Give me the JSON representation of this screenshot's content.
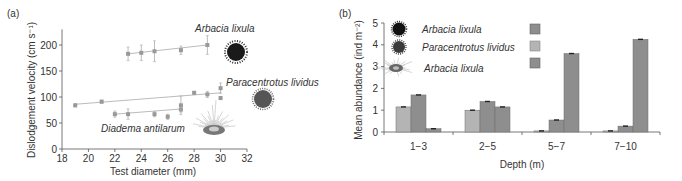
{
  "chart_data": [
    {
      "panel": "(a)",
      "type": "scatter",
      "title": "",
      "xlabel": "Test diameter (mm)",
      "ylabel": "Dislodgement velocity (cm s⁻¹)",
      "xlim": [
        18,
        32
      ],
      "ylim": [
        0,
        230
      ],
      "xticks": [
        18,
        20,
        22,
        24,
        26,
        28,
        30,
        32
      ],
      "yticks": [
        0,
        50,
        100,
        150,
        200
      ],
      "grid": false,
      "series": [
        {
          "name": "Arbacia lixula",
          "points": [
            {
              "x": 23,
              "y": 183,
              "err": 13
            },
            {
              "x": 24,
              "y": 185,
              "err": 15
            },
            {
              "x": 25,
              "y": 188,
              "err": 20
            },
            {
              "x": 27,
              "y": 190,
              "err": 8
            },
            {
              "x": 29,
              "y": 200,
              "err": 18
            }
          ],
          "trend": {
            "x": [
              23,
              29
            ],
            "y": [
              183,
              200
            ]
          }
        },
        {
          "name": "Paracentrotus lividus",
          "points": [
            {
              "x": 19,
              "y": 84,
              "err": 3
            },
            {
              "x": 21,
              "y": 91,
              "err": 3
            },
            {
              "x": 28,
              "y": 108,
              "err": 3
            },
            {
              "x": 29,
              "y": 105,
              "err": 6
            },
            {
              "x": 30,
              "y": 117,
              "err": 10
            },
            {
              "x": 30,
              "y": 98,
              "err": 3
            }
          ],
          "trend": {
            "x": [
              19,
              30
            ],
            "y": [
              86,
              108
            ]
          }
        },
        {
          "name": "Diadema antilarum",
          "points": [
            {
              "x": 22,
              "y": 67,
              "err": 6
            },
            {
              "x": 23,
              "y": 67,
              "err": 10
            },
            {
              "x": 25,
              "y": 67,
              "err": 5
            },
            {
              "x": 26,
              "y": 62,
              "err": 5
            },
            {
              "x": 27,
              "y": 76,
              "err": 5
            },
            {
              "x": 27,
              "y": 84,
              "err": 18
            }
          ],
          "trend": {
            "x": [
              22,
              27
            ],
            "y": [
              67,
              77
            ]
          }
        }
      ],
      "annotations": [
        "Arbacia lixula",
        "Paracentrotus lividus",
        "Diadema antilarum"
      ]
    },
    {
      "panel": "(b)",
      "type": "bar",
      "title": "",
      "xlabel": "Depth (m)",
      "ylabel": "Mean abundance (ind m⁻²)",
      "categories": [
        "1−3",
        "2−5",
        "5−7",
        "7−10"
      ],
      "ylim": [
        0,
        5
      ],
      "yticks": [
        0,
        1,
        2,
        3,
        4,
        5
      ],
      "grid": false,
      "legend_position": "top-left",
      "series": [
        {
          "name": "Paracentrotus lividus",
          "color": "#b4b4b4",
          "values": [
            1.15,
            1.0,
            0.05,
            0.05
          ]
        },
        {
          "name": "Arbacia lixula",
          "color": "#8e8e8e",
          "values": [
            1.7,
            1.4,
            0.55,
            0.27
          ]
        },
        {
          "name": "Diadema antilarum",
          "color": "#8e8e8e",
          "values": [
            0.15,
            1.15,
            3.6,
            4.25
          ]
        }
      ],
      "legend": [
        {
          "label": "Arbacia lixula",
          "swatch": "#8e8e8e"
        },
        {
          "label": "Paracentrotus lividus",
          "swatch": "#b4b4b4"
        },
        {
          "label": "Arbacia lixula",
          "swatch": "#8e8e8e"
        }
      ]
    }
  ],
  "panel_a": {
    "label": "(a)",
    "ylabel": "Dislodgement velocity (cm s⁻¹)",
    "xlabel": "Test diameter (mm)",
    "ann_arbacia": "Arbacia lixula",
    "ann_paracentrotus": "Paracentrotus lividus",
    "ann_diadema": "Diadema antilarum"
  },
  "panel_b": {
    "label": "(b)",
    "ylabel": "Mean abundance (ind m⁻²)",
    "xlabel": "Depth (m)",
    "legend_labels": [
      "Arbacia lixula",
      "Paracentrotus lividus",
      "Arbacia lixula"
    ]
  },
  "colors": {
    "axis": "#555555",
    "point": "#999999",
    "bar_light": "#b4b4b4",
    "bar_dark": "#8e8e8e"
  }
}
